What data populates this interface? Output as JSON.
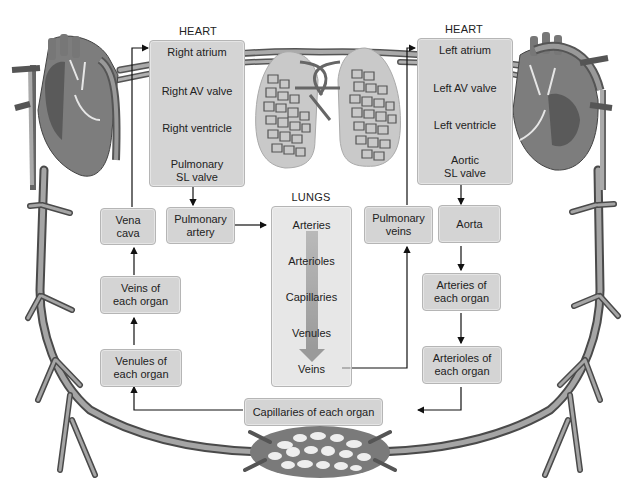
{
  "right_heart": {
    "heading": "HEART",
    "steps": [
      "Right atrium",
      "Right AV valve",
      "Right ventricle",
      "Pulmonary",
      "SL valve"
    ]
  },
  "left_heart": {
    "heading": "HEART",
    "steps": [
      "Left atrium",
      "Left AV valve",
      "Left ventricle",
      "Aortic",
      "SL valve"
    ]
  },
  "lungs": {
    "heading": "LUNGS",
    "steps": [
      "Arteries",
      "Arterioles",
      "Capillaries",
      "Venules",
      "Veins"
    ]
  },
  "boxes": {
    "vena_cava": [
      "Vena",
      "cava"
    ],
    "pulmonary_artery": [
      "Pulmonary",
      "artery"
    ],
    "pulmonary_veins": [
      "Pulmonary",
      "veins"
    ],
    "aorta": [
      "Aorta"
    ],
    "veins_of_each_organ": [
      "Veins of",
      "each organ"
    ],
    "venules_of_each_organ": [
      "Venules of",
      "each organ"
    ],
    "arteries_of_each_organ": [
      "Arteries of",
      "each organ"
    ],
    "arterioles_of_each_organ": [
      "Arterioles of",
      "each organ"
    ],
    "capillaries_of_each_organ": [
      "Capillaries of each organ"
    ]
  },
  "colors": {
    "box_fill": "#d4d4d4",
    "box_border": "#b5b5b5",
    "vessel": "#8a8a8a",
    "vessel_dark": "#5a5a5a",
    "arrow": "#111111"
  }
}
